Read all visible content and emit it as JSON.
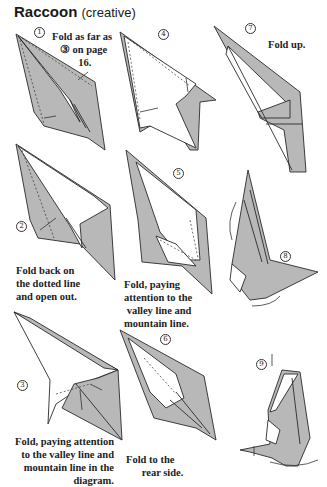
{
  "page": {
    "title": "Raccoon",
    "subtitle": "(creative)"
  },
  "colors": {
    "paper_grey": "#b8b8b8",
    "ink": "#2a2a2a",
    "background": "#ffffff"
  },
  "steps": [
    {
      "number": "1",
      "lines": [
        "Fold as far as",
        "③ on page",
        "16."
      ]
    },
    {
      "number": "2",
      "lines": [
        "Fold back on",
        "the dotted line",
        "and open out."
      ]
    },
    {
      "number": "3",
      "lines": [
        "Fold, paying attention",
        "to the valley line and",
        "mountain line in the",
        "diagram."
      ]
    },
    {
      "number": "4",
      "lines": []
    },
    {
      "number": "5",
      "lines": [
        "Fold, paying",
        "attention to the",
        "valley line and",
        "mountain line."
      ]
    },
    {
      "number": "6",
      "lines": [
        "Fold to the",
        "rear side."
      ]
    },
    {
      "number": "7",
      "lines": [
        "Fold up."
      ]
    },
    {
      "number": "8",
      "lines": []
    },
    {
      "number": "9",
      "lines": []
    }
  ],
  "captions": {
    "step1": "Fold as far as\n   ③ on page\n          16.",
    "step2": "Fold back on\nthe dotted line\nand open out.",
    "step3": "Fold, paying attention\nto the valley line and\nmountain line in the\ndiagram.",
    "step5": "Fold, paying\nattention to the\n valley line and\nmountain line.",
    "step6": "Fold to the\n      rear side.",
    "step7": "Fold up."
  }
}
